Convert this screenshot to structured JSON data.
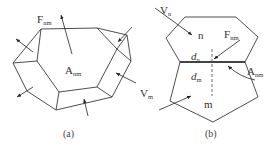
{
  "figure_a": {
    "caption": "(a)",
    "labels": {
      "face": {
        "main": "F",
        "sub": "nm"
      },
      "area": {
        "main": "A",
        "sub": "nm"
      }
    }
  },
  "figure_b": {
    "caption": "(b)",
    "labels": {
      "vn": {
        "main": "V",
        "sub": "n"
      },
      "vm": {
        "main": "V",
        "sub": "m"
      },
      "n": "n",
      "m": "m",
      "fnm": {
        "main": "F",
        "sub": "nm"
      },
      "anm": {
        "main": "A",
        "sub": "nm"
      },
      "dn": {
        "main": "d",
        "sub": "n"
      },
      "dm": {
        "main": "d",
        "sub": "m"
      }
    }
  },
  "colors": {
    "line": "#3a3a3a",
    "text": "#333333",
    "background": "#ffffff"
  }
}
